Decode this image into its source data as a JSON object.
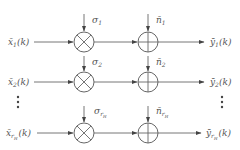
{
  "diagram": {
    "type": "signal-channel-block-diagram",
    "rows": [
      {
        "input": "x̄₁(k)",
        "input_base": "x̄",
        "input_sub": "1",
        "gain": "σ",
        "gain_sub": "1",
        "noise": "n̄",
        "noise_sub": "1",
        "output": "ȳ₁(k)",
        "output_base": "ȳ",
        "output_sub": "1",
        "arg": "(k)"
      },
      {
        "input": "x̄₂(k)",
        "input_base": "x̄",
        "input_sub": "2",
        "gain": "σ",
        "gain_sub": "2",
        "noise": "n̄",
        "noise_sub": "2",
        "output": "ȳ₂(k)",
        "output_base": "ȳ",
        "output_sub": "2",
        "arg": "(k)"
      },
      {
        "input": "x̄_{r_H}(k)",
        "input_base": "x̄",
        "input_sub": "r",
        "input_subsub": "H",
        "gain": "σ",
        "gain_sub": "r",
        "gain_subsub": "H",
        "noise": "n̄",
        "noise_sub": "r",
        "noise_subsub": "H",
        "output": "ȳ_{r_H}(k)",
        "output_base": "ȳ",
        "output_sub": "r",
        "output_subsub": "H",
        "arg": "(k)"
      }
    ],
    "ellipsis": "⋮",
    "multiplier_symbol": "×",
    "adder_symbol": "+"
  }
}
